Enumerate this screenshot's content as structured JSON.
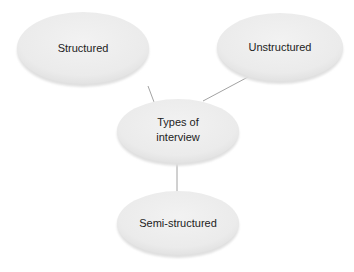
{
  "diagram": {
    "type": "mind-map",
    "center": {
      "id": "types",
      "lines": [
        "Types of",
        "interview"
      ]
    },
    "nodes": [
      {
        "id": "structured",
        "label": "Structured"
      },
      {
        "id": "unstructured",
        "label": "Unstructured"
      },
      {
        "id": "semi",
        "label": "Semi-structured"
      }
    ],
    "edges": [
      {
        "from": "types",
        "to": "structured"
      },
      {
        "from": "types",
        "to": "unstructured"
      },
      {
        "from": "types",
        "to": "semi"
      }
    ]
  },
  "colors": {
    "node_fill": "#ececec",
    "node_shadow": "#dcdcdc",
    "edge": "#8a8a8a",
    "text": "#222222",
    "background": "#ffffff"
  }
}
